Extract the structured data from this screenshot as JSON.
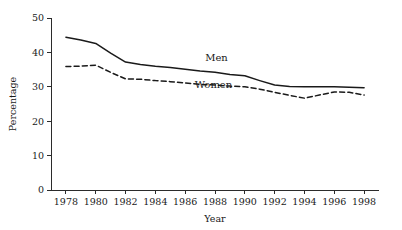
{
  "chart_data": {
    "type": "line",
    "title": "",
    "subtitle": "",
    "xlabel": "Year",
    "ylabel": "Percentage",
    "x": [
      1978,
      1979,
      1980,
      1981,
      1982,
      1983,
      1984,
      1985,
      1986,
      1987,
      1988,
      1989,
      1990,
      1991,
      1992,
      1993,
      1994,
      1995,
      1996,
      1997,
      1998
    ],
    "xlim": [
      1977,
      1999
    ],
    "ylim": [
      0,
      50
    ],
    "grid": false,
    "legend_position": "inline-annotation",
    "x_tick_labels": [
      "1978",
      "1980",
      "1982",
      "1984",
      "1986",
      "1988",
      "1990",
      "1992",
      "1994",
      "1996",
      "1998"
    ],
    "x_ticks": [
      1978,
      1980,
      1982,
      1984,
      1986,
      1988,
      1990,
      1992,
      1994,
      1996,
      1998
    ],
    "y_tick_labels": [
      "0",
      "10",
      "20",
      "30",
      "40",
      "50"
    ],
    "y_ticks": [
      0,
      10,
      20,
      30,
      40,
      50
    ],
    "series": [
      {
        "name": "Men",
        "style": "solid",
        "color": "#1a1a1a",
        "label_x": 1988.1,
        "label_y": 37.4,
        "values": [
          44.4,
          43.6,
          42.6,
          39.8,
          37.2,
          36.5,
          36.0,
          35.6,
          35.1,
          34.6,
          34.2,
          33.6,
          33.2,
          31.8,
          30.5,
          30.1,
          30.0,
          30.0,
          30.0,
          29.9,
          29.7
        ]
      },
      {
        "name": "Women",
        "style": "dashed",
        "color": "#1a1a1a",
        "label_x": 1987.9,
        "label_y": 29.6,
        "values": [
          35.9,
          36.0,
          36.3,
          34.2,
          32.3,
          32.2,
          31.8,
          31.5,
          31.1,
          30.7,
          30.5,
          30.2,
          30.0,
          29.3,
          28.4,
          27.5,
          26.7,
          27.6,
          28.5,
          28.4,
          27.6
        ]
      }
    ],
    "annotations": [
      {
        "text": "Men",
        "x": 1988.1,
        "y": 37.4
      },
      {
        "text": "Women",
        "x": 1987.9,
        "y": 29.6
      }
    ]
  }
}
